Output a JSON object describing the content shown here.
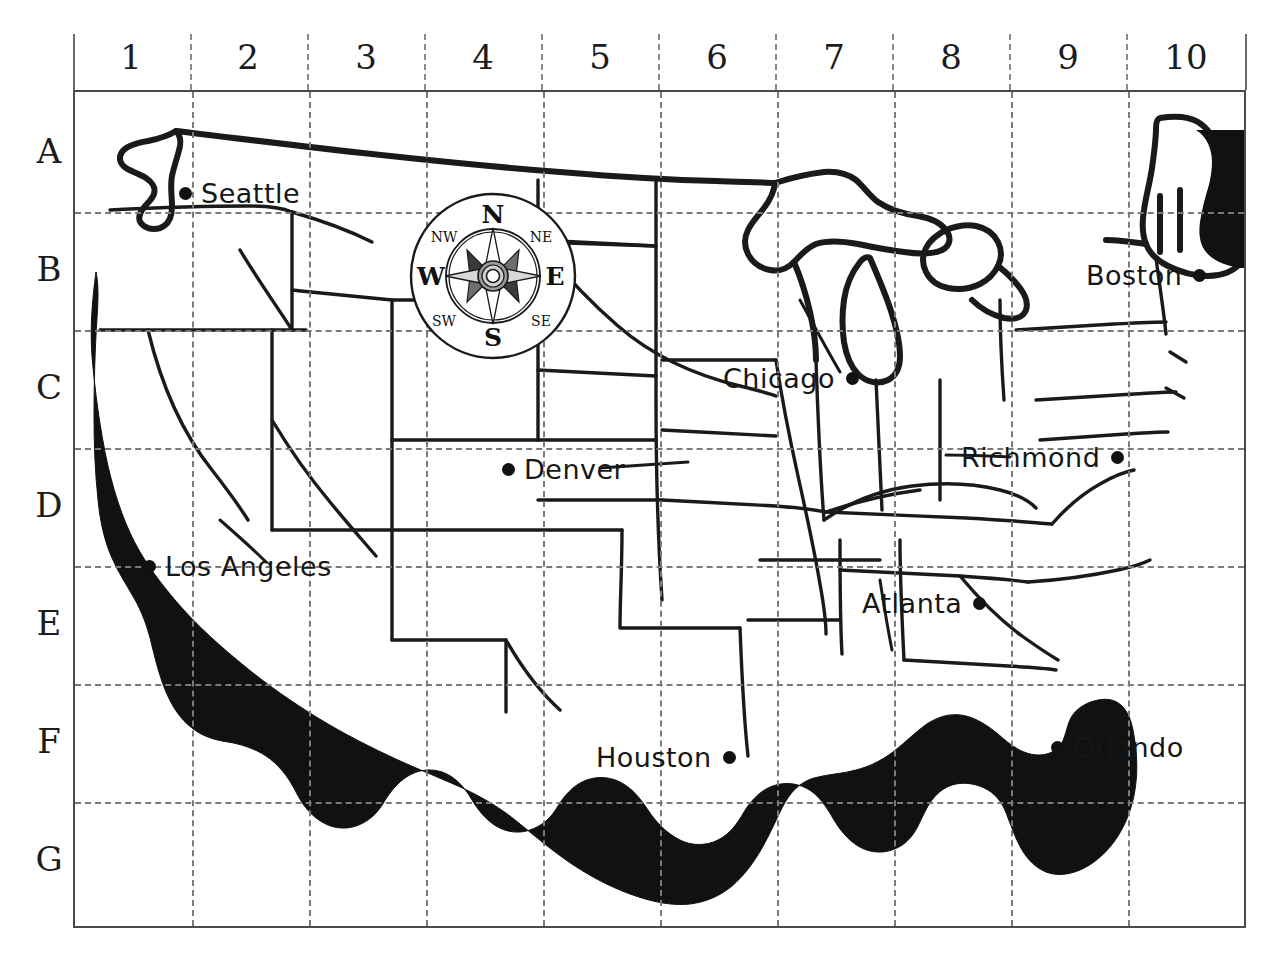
{
  "map": {
    "title": "United States grid reference map",
    "columns": [
      "1",
      "2",
      "3",
      "4",
      "5",
      "6",
      "7",
      "8",
      "9",
      "10"
    ],
    "rows": [
      "A",
      "B",
      "C",
      "D",
      "E",
      "F",
      "G"
    ],
    "colors": {
      "coastline_shadow": "#111111",
      "state_border": "#1a1a1a",
      "grid_line": "#7a7a7a",
      "frame": "#4a4a4a",
      "label_text": "#161616"
    },
    "cities": [
      {
        "name": "Seattle",
        "grid": "A1",
        "label_side": "right",
        "x": 185,
        "y": 193
      },
      {
        "name": "Boston",
        "grid": "B10",
        "label_side": "left",
        "x": 1181,
        "y": 275
      },
      {
        "name": "Chicago",
        "grid": "C7",
        "label_side": "left",
        "x": 845,
        "y": 378
      },
      {
        "name": "Denver",
        "grid": "D4",
        "label_side": "right",
        "x": 508,
        "y": 469
      },
      {
        "name": "Richmond",
        "grid": "D9",
        "label_side": "left",
        "x": 1093,
        "y": 457
      },
      {
        "name": "Los Angeles",
        "grid": "E1",
        "label_side": "right",
        "x": 149,
        "y": 566
      },
      {
        "name": "Atlanta",
        "grid": "E8",
        "label_side": "left",
        "x": 967,
        "y": 603
      },
      {
        "name": "Houston",
        "grid": "F5",
        "label_side": "left",
        "x": 722,
        "y": 757
      },
      {
        "name": "Orlando",
        "grid": "F9",
        "label_side": "right",
        "x": 1057,
        "y": 747
      }
    ],
    "compass": {
      "cardinals": {
        "n": "N",
        "e": "E",
        "s": "S",
        "w": "W"
      },
      "intercardinals": {
        "ne": "NE",
        "se": "SE",
        "sw": "SW",
        "nw": "NW"
      }
    }
  }
}
